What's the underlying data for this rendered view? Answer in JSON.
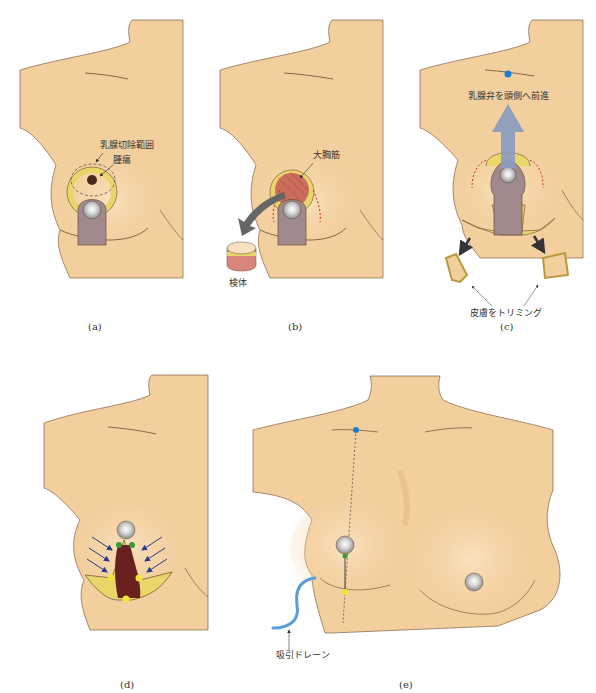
{
  "figure": {
    "panels": [
      {
        "id": "a",
        "caption": "(a)",
        "labels": {
          "resection_range": "乳腺切除範囲",
          "tumor": "腫瘍"
        }
      },
      {
        "id": "b",
        "caption": "(b)",
        "labels": {
          "pectoralis_major": "大胸筋",
          "specimen": "検体"
        }
      },
      {
        "id": "c",
        "caption": "(c)",
        "labels": {
          "advance_flap": "乳腺弁を頭側へ前進",
          "trim_skin": "皮膚をトリミング"
        }
      },
      {
        "id": "d",
        "caption": "(d)",
        "labels": {}
      },
      {
        "id": "e",
        "caption": "(e)",
        "labels": {
          "suction_drain": "吸引ドレーン"
        }
      }
    ],
    "colors": {
      "skin": "#f3cf9e",
      "skin_shadow": "#e2b57f",
      "outline": "#6b4a30",
      "pedicle": "#a08a8e",
      "areola_ring": "#e9d66a",
      "nipple": "#cfcfcf",
      "tumor": "#4a2a20",
      "muscle": "#c9615a",
      "arrow_gray": "#666666",
      "arrow_blue": "#8a9cc0",
      "point_blue": "#1a7fd0",
      "point_green": "#3a9a3a",
      "point_yellow": "#f3e23a",
      "drain": "#5b9fd4",
      "push_arrow": "#2a3a8a",
      "red_dash": "#d03020"
    }
  }
}
